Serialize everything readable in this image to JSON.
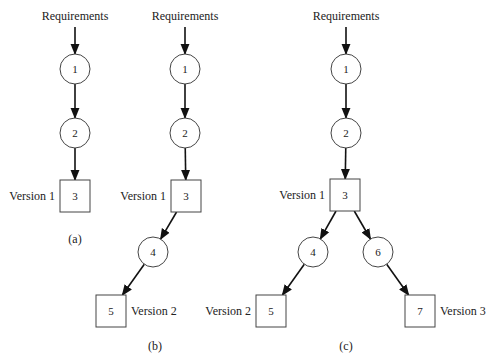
{
  "colors": {
    "line": "#111111",
    "node_stroke": "#444444",
    "text": "#222222",
    "background": "#ffffff"
  },
  "diagrams": [
    {
      "id": "a",
      "caption": "(a)",
      "source_label": "Requirements",
      "nodes": [
        {
          "id": "1",
          "shape": "circle",
          "label": "1",
          "cx": 75,
          "cy": 69
        },
        {
          "id": "2",
          "shape": "circle",
          "label": "2",
          "cx": 75,
          "cy": 133
        },
        {
          "id": "3",
          "shape": "box",
          "label": "3",
          "cx": 75,
          "cy": 196,
          "version": "Version 1",
          "version_side": "left"
        }
      ],
      "edges": [
        [
          "src",
          "1"
        ],
        [
          "1",
          "2"
        ],
        [
          "2",
          "3"
        ]
      ]
    },
    {
      "id": "b",
      "caption": "(b)",
      "source_label": "Requirements",
      "nodes": [
        {
          "id": "1",
          "shape": "circle",
          "label": "1",
          "cx": 185,
          "cy": 69
        },
        {
          "id": "2",
          "shape": "circle",
          "label": "2",
          "cx": 185,
          "cy": 133
        },
        {
          "id": "3",
          "shape": "box",
          "label": "3",
          "cx": 186,
          "cy": 196,
          "version": "Version 1",
          "version_side": "left"
        },
        {
          "id": "4",
          "shape": "circle",
          "label": "4",
          "cx": 153,
          "cy": 252
        },
        {
          "id": "5",
          "shape": "box",
          "label": "5",
          "cx": 111,
          "cy": 311,
          "version": "Version 2",
          "version_side": "right"
        }
      ],
      "edges": [
        [
          "src",
          "1"
        ],
        [
          "1",
          "2"
        ],
        [
          "2",
          "3"
        ],
        [
          "3",
          "4"
        ],
        [
          "4",
          "5"
        ]
      ]
    },
    {
      "id": "c",
      "caption": "(c)",
      "source_label": "Requirements",
      "nodes": [
        {
          "id": "1",
          "shape": "circle",
          "label": "1",
          "cx": 346,
          "cy": 69
        },
        {
          "id": "2",
          "shape": "circle",
          "label": "2",
          "cx": 346,
          "cy": 133
        },
        {
          "id": "3",
          "shape": "box",
          "label": "3",
          "cx": 345,
          "cy": 195,
          "version": "Version 1",
          "version_side": "left"
        },
        {
          "id": "4",
          "shape": "circle",
          "label": "4",
          "cx": 313,
          "cy": 252
        },
        {
          "id": "6",
          "shape": "circle",
          "label": "6",
          "cx": 378,
          "cy": 252
        },
        {
          "id": "5",
          "shape": "box",
          "label": "5",
          "cx": 271,
          "cy": 311,
          "version": "Version 2",
          "version_side": "left"
        },
        {
          "id": "7",
          "shape": "box",
          "label": "7",
          "cx": 420,
          "cy": 311,
          "version": "Version 3",
          "version_side": "right"
        }
      ],
      "edges": [
        [
          "src",
          "1"
        ],
        [
          "1",
          "2"
        ],
        [
          "2",
          "3"
        ],
        [
          "3",
          "4"
        ],
        [
          "3",
          "6"
        ],
        [
          "4",
          "5"
        ],
        [
          "6",
          "7"
        ]
      ]
    }
  ],
  "captions_y": 243,
  "captions_bottom_y": 350
}
